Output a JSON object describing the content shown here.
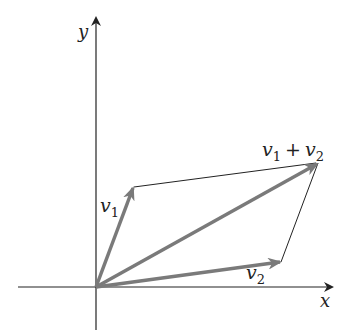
{
  "diagram": {
    "type": "vector-parallelogram",
    "axes": {
      "x_label": "x",
      "y_label": "y"
    },
    "vectors": [
      {
        "name": "v1",
        "label": "v",
        "subscript": "1"
      },
      {
        "name": "v2",
        "label": "v",
        "subscript": "2"
      },
      {
        "name": "sum",
        "label_a": "v",
        "sub_a": "1",
        "op": "+",
        "label_b": "v",
        "sub_b": "2"
      }
    ],
    "colors": {
      "axis": "#222222",
      "vector": "#7a7a7a",
      "edge": "#222222"
    }
  }
}
